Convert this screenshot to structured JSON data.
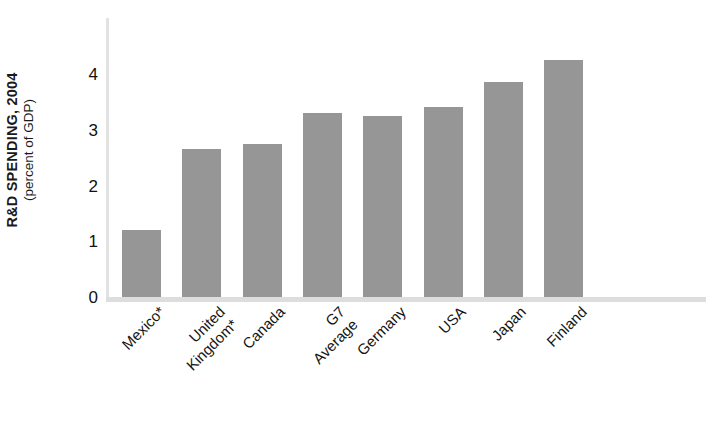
{
  "chart_data": {
    "type": "bar",
    "title": "",
    "ylabel": "R&D SPENDING, 2004",
    "ylabel_sub": "(percent of GDP)",
    "xlabel": "",
    "categories": [
      "Mexico*",
      "United\nKingdom*",
      "Canada",
      "G7\nAverage",
      "Germany",
      "USA",
      "Japan",
      "Finland"
    ],
    "values": [
      1.2,
      2.65,
      2.75,
      3.3,
      3.25,
      3.4,
      3.85,
      4.25
    ],
    "ylim": [
      0,
      4.6
    ],
    "yticks": [
      "0",
      "1",
      "2",
      "3",
      "4"
    ],
    "ytick_values": [
      0,
      1,
      2,
      3,
      4
    ],
    "grid": false,
    "legend": "none",
    "bar_color": "#969696",
    "axis_color": "#dddddd",
    "footnote_marker": "*"
  },
  "axis": {
    "y_title_main": "R&D SPENDING, 2004",
    "y_title_sub": "(percent of GDP)"
  }
}
